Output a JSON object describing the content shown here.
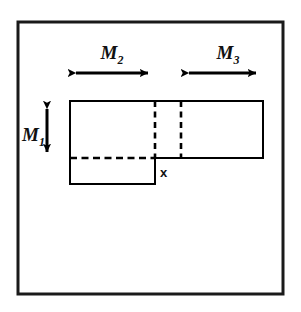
{
  "figure": {
    "background_color": "#ffffff",
    "frame": {
      "name": "outer-border",
      "stroke_color": "#1a1a1a",
      "stroke_width": 3,
      "x": 18,
      "y": 22,
      "width": 265,
      "height": 272
    },
    "shape": {
      "stroke_color": "#000000",
      "solid_stroke_width": 2,
      "dashed_stroke_width": 2,
      "dash_pattern": "6,4",
      "upper_rect": {
        "x": 70,
        "y": 101,
        "width": 193,
        "height": 57
      },
      "lower_rect": {
        "x": 70,
        "y": 158,
        "width": 85,
        "height": 26
      },
      "dashed_horizontal": {
        "x1": 70,
        "y1": 158,
        "x2": 155,
        "y2": 158
      },
      "dashed_vertical_left": {
        "x": 155,
        "y1": 101,
        "y2": 158
      },
      "dashed_vertical_right": {
        "x": 181,
        "y1": 101,
        "y2": 158
      }
    },
    "arrows": [
      {
        "name": "m2-dimension-arrow",
        "orientation": "horizontal",
        "x1": 68,
        "x2": 156,
        "y": 73,
        "label": "M",
        "subscript": "2",
        "label_x": 112,
        "label_y": 59
      },
      {
        "name": "m3-dimension-arrow",
        "orientation": "horizontal",
        "x1": 181,
        "x2": 264,
        "y": 73,
        "label": "M",
        "subscript": "3",
        "label_x": 228,
        "label_y": 59
      },
      {
        "name": "m1-dimension-arrow",
        "orientation": "vertical",
        "x": 47,
        "y1": 101,
        "y2": 160,
        "label": "M",
        "subscript": "1",
        "label_x": 22,
        "label_y": 136
      }
    ],
    "annotations": [
      {
        "name": "x-point-label",
        "text": "x",
        "x": 160,
        "y": 177
      }
    ]
  }
}
